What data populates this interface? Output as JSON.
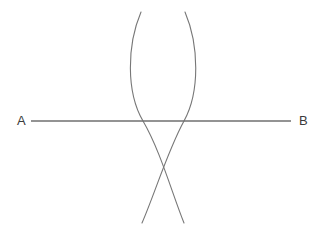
{
  "figure": {
    "background_color": "#ffffff",
    "width": 322,
    "height": 236,
    "line_color": "#6f6f6f",
    "arc_color": "#777777",
    "label_color": "#3b3b3b",
    "segment": {
      "name": "segment-ab",
      "start_label": "A",
      "end_label": "B",
      "start_x": 31,
      "end_x": 291,
      "y": 121,
      "stroke_width": 1.4
    },
    "labels": {
      "a": "A",
      "b": "B"
    },
    "arcs": [
      {
        "name": "arc-from-a",
        "description": "Compass arc swung from point A, bulging to the left",
        "start_x": 141,
        "start_y": 12,
        "apex_x": 143,
        "apex_y": 121,
        "end_x": 184,
        "end_y": 223,
        "stroke_width": 1.1
      },
      {
        "name": "arc-from-b",
        "description": "Compass arc swung from point B, bulging to the right",
        "start_x": 185,
        "start_y": 12,
        "apex_x": 184,
        "apex_y": 121,
        "end_x": 142,
        "end_y": 223,
        "stroke_width": 1.1
      }
    ],
    "intersections": [
      {
        "name": "upper-intersection",
        "x": 165,
        "y": 38
      },
      {
        "name": "lower-intersection",
        "x": 165,
        "y": 197
      }
    ],
    "path_arc_a": "M 141 12 C 127 45, 126 92, 143 121 C 160 150, 172 193, 184 223",
    "path_arc_b": "M 185 12 C 199 45, 200 92, 184 121 C 168 150, 155 193, 142 223"
  }
}
